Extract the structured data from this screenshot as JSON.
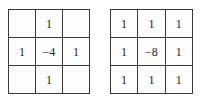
{
  "figure": {
    "type": "matrix-pair",
    "background_color": "#ffffff",
    "line_color": "#3a3a3a",
    "text_color": "#252525"
  },
  "matrices": [
    {
      "name": "laplacian-4-neighbor-kernel",
      "rows": [
        [
          "",
          "1",
          ""
        ],
        [
          "1",
          "−4",
          "1"
        ],
        [
          "",
          "1",
          ""
        ]
      ]
    },
    {
      "name": "laplacian-8-neighbor-kernel",
      "rows": [
        [
          "1",
          "1",
          "1"
        ],
        [
          "1",
          "−8",
          "1"
        ],
        [
          "1",
          "1",
          "1"
        ]
      ]
    }
  ]
}
